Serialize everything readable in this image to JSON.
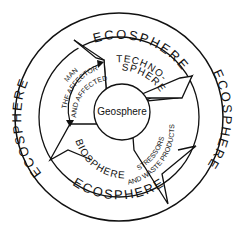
{
  "diagram": {
    "outer_ring_label": "ECOSPHERE",
    "outer_ring_labels": [
      "ECOSPHERE",
      "ECOSPHERE",
      "ECOSPHERE",
      "ECOSPHERE"
    ],
    "center_label": "Geosphere",
    "technosphere_line1": "TECHNO-",
    "technosphere_line2": "SPHERE",
    "biosphere_label": "BIOSPHERE",
    "man_label": "MAN",
    "affector_label": "THE AFFECTOR",
    "affected_label": "AND AFFECTED",
    "stressors_label": "STRESSORS",
    "waste_label": "AND WASTE PRODUCTS",
    "colors": {
      "line": "#111111",
      "background": "#ffffff"
    }
  }
}
